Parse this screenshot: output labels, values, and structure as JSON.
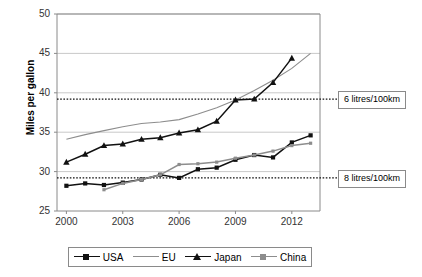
{
  "chart_data": {
    "type": "line",
    "title": "",
    "xlabel": "",
    "ylabel": "Miles per gallon",
    "xlim": [
      1999.5,
      2013.5
    ],
    "ylim": [
      25,
      50
    ],
    "xticks": [
      "2000",
      "2003",
      "2006",
      "2009",
      "2012"
    ],
    "yticks": [
      "25",
      "30",
      "35",
      "40",
      "45",
      "50"
    ],
    "grid": true,
    "legend_position": "bottom",
    "x": [
      2000,
      2001,
      2002,
      2003,
      2004,
      2005,
      2006,
      2007,
      2008,
      2009,
      2010,
      2011,
      2012,
      2013
    ],
    "series": [
      {
        "name": "USA",
        "color": "#111111",
        "marker": "square",
        "values": [
          28.2,
          28.5,
          28.3,
          28.6,
          29.0,
          29.6,
          29.2,
          30.3,
          30.5,
          31.5,
          32.1,
          31.8,
          33.7,
          34.6
        ]
      },
      {
        "name": "EU",
        "color": "#8d8d8d",
        "marker": "none",
        "values": [
          34.1,
          34.7,
          35.2,
          35.7,
          36.1,
          36.3,
          36.6,
          37.3,
          38.1,
          39.1,
          40.3,
          41.6,
          43.1,
          45.0
        ]
      },
      {
        "name": "Japan",
        "color": "#111111",
        "marker": "triangle",
        "values": [
          31.2,
          32.2,
          33.3,
          33.5,
          34.1,
          34.3,
          34.9,
          35.3,
          36.4,
          39.1,
          39.2,
          41.3,
          44.4,
          null
        ]
      },
      {
        "name": "China",
        "color": "#8d8d8d",
        "marker": "dot",
        "values": [
          null,
          null,
          27.7,
          28.5,
          29.0,
          29.6,
          30.9,
          31.0,
          31.2,
          31.7,
          32.1,
          32.6,
          33.3,
          33.6
        ]
      }
    ],
    "reference_lines": [
      {
        "label": "6 litres/100km",
        "value": 39.2
      },
      {
        "label": "8 litres/100km",
        "value": 29.2
      }
    ]
  }
}
